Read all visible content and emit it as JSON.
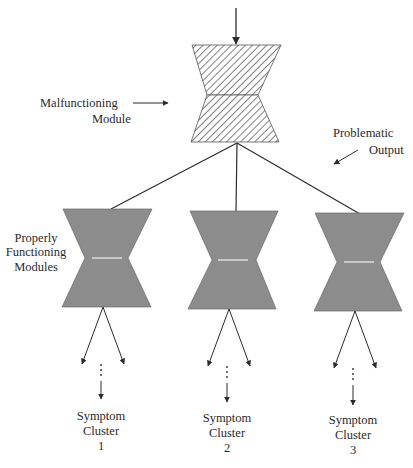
{
  "diagram": {
    "type": "hierarchical-module-diagram",
    "colors": {
      "line": "#2b2b2b",
      "faulty_hatch": "#444444",
      "faulty_fill": "#ffffff",
      "healthy_fill": "#8c8c8c",
      "healthy_waist_highlight": "#e8e8e8",
      "text": "#2a2a2a"
    },
    "top_module": {
      "label_line1": "Malfunctioning",
      "label_line2": "Module",
      "pattern": "hatched"
    },
    "problematic_output": {
      "label_line1": "Problematic",
      "label_line2": "Output"
    },
    "child_modules_label": {
      "line1": "Properly",
      "line2": "Functioning",
      "line3": "Modules"
    },
    "symptom_clusters": [
      {
        "line1": "Symptom",
        "line2": "Cluster",
        "number": "1"
      },
      {
        "line1": "Symptom",
        "line2": "Cluster",
        "number": "2"
      },
      {
        "line1": "Symptom",
        "line2": "Cluster",
        "number": "3"
      }
    ],
    "ellipsis": "⋮"
  }
}
